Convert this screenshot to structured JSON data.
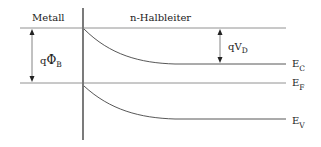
{
  "diagram": {
    "type": "band-diagram",
    "regions": {
      "metal_label": "Metall",
      "semiconductor_label": "n-Halbleiter"
    },
    "energy_levels": [
      {
        "name": "E",
        "sub": "C",
        "label": "E_C"
      },
      {
        "name": "E",
        "sub": "F",
        "label": "E_F"
      },
      {
        "name": "E",
        "sub": "V",
        "label": "E_V"
      }
    ],
    "annotations": {
      "barrier_height": {
        "prefix": "q",
        "symbol": "Φ",
        "sub": "B"
      },
      "diffusion_voltage": {
        "prefix": "qV",
        "sub": "D"
      }
    },
    "colors": {
      "line": "#444444",
      "text": "#222222"
    }
  }
}
